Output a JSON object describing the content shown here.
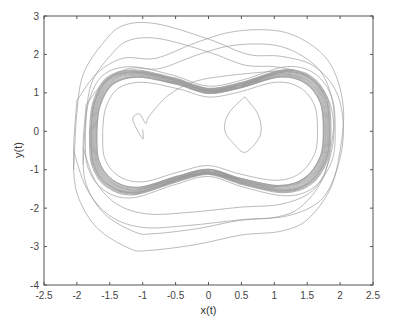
{
  "chart_data": {
    "type": "line",
    "title": "",
    "xlabel": "x(t)",
    "ylabel": "y(t)",
    "xlim": [
      -2.5,
      2.5
    ],
    "ylim": [
      -4,
      3
    ],
    "xticks": [
      -2.5,
      -2,
      -1.5,
      -1,
      -0.5,
      0,
      0.5,
      1,
      1.5,
      2,
      2.5
    ],
    "xtick_labels": [
      "-2.5",
      "-2",
      "-1.5",
      "-1",
      "-0.5",
      "0",
      "0.5",
      "1",
      "1.5",
      "2",
      "2.5"
    ],
    "yticks": [
      -4,
      -3,
      -2,
      -1,
      0,
      1,
      2,
      3
    ],
    "ytick_labels": [
      "-4",
      "-3",
      "-2",
      "-1",
      "0",
      "1",
      "2",
      "3"
    ],
    "grid": false,
    "legend": null,
    "line_color": "#999999",
    "series": [
      {
        "name": "attractor core",
        "points": [
          [
            -1.75,
            0
          ],
          [
            -1.7,
            0.7
          ],
          [
            -1.5,
            1.3
          ],
          [
            -1.1,
            1.5
          ],
          [
            -0.5,
            1.3
          ],
          [
            0,
            1.05
          ],
          [
            0.5,
            1.2
          ],
          [
            1.1,
            1.5
          ],
          [
            1.5,
            1.35
          ],
          [
            1.75,
            0.8
          ],
          [
            1.8,
            0
          ],
          [
            1.75,
            -0.7
          ],
          [
            1.5,
            -1.3
          ],
          [
            1.1,
            -1.5
          ],
          [
            0.5,
            -1.3
          ],
          [
            0,
            -1.05
          ],
          [
            -0.5,
            -1.25
          ],
          [
            -1.1,
            -1.55
          ],
          [
            -1.5,
            -1.35
          ],
          [
            -1.72,
            -0.8
          ],
          [
            -1.75,
            0
          ]
        ]
      },
      {
        "name": "outer transient upper",
        "points": [
          [
            -2.05,
            -1.0
          ],
          [
            -2.0,
            0.5
          ],
          [
            -1.9,
            1.5
          ],
          [
            -1.6,
            2.3
          ],
          [
            -1.3,
            2.75
          ],
          [
            -0.8,
            2.8
          ],
          [
            0,
            2.4
          ],
          [
            0.6,
            2.0
          ],
          [
            1.1,
            1.95
          ],
          [
            1.6,
            1.7
          ],
          [
            1.95,
            1.0
          ],
          [
            2.05,
            0
          ],
          [
            1.95,
            -1.0
          ],
          [
            1.7,
            -1.8
          ],
          [
            1.2,
            -2.2
          ],
          [
            0.5,
            -2.3
          ],
          [
            -0.3,
            -2.45
          ],
          [
            -1.0,
            -2.5
          ],
          [
            -1.5,
            -2.2
          ],
          [
            -1.85,
            -1.5
          ],
          [
            -2.05,
            -0.5
          ]
        ]
      },
      {
        "name": "outer transient lower",
        "points": [
          [
            -2.0,
            0.8
          ],
          [
            -2.05,
            -0.5
          ],
          [
            -2.0,
            -1.6
          ],
          [
            -1.7,
            -2.5
          ],
          [
            -1.2,
            -3.05
          ],
          [
            -0.9,
            -3.1
          ],
          [
            -0.2,
            -2.95
          ],
          [
            0.5,
            -2.7
          ],
          [
            1.1,
            -2.6
          ],
          [
            1.5,
            -2.3
          ],
          [
            1.85,
            -1.5
          ],
          [
            2.0,
            -0.5
          ],
          [
            2.05,
            0.6
          ],
          [
            1.9,
            1.6
          ],
          [
            1.6,
            2.2
          ],
          [
            1.1,
            2.6
          ],
          [
            0.4,
            2.6
          ],
          [
            -0.2,
            2.3
          ],
          [
            -0.8,
            1.9
          ],
          [
            -1.3,
            1.9
          ],
          [
            -1.7,
            1.5
          ],
          [
            -2.0,
            0.8
          ]
        ]
      },
      {
        "name": "initial spiral",
        "points": [
          [
            -1.0,
            0.05
          ],
          [
            -1.0,
            -0.2
          ],
          [
            -1.15,
            0.3
          ],
          [
            -1.05,
            0.45
          ],
          [
            -0.95,
            0.2
          ],
          [
            -0.9,
            0.4
          ],
          [
            -0.6,
            0.95
          ],
          [
            -0.2,
            1.3
          ],
          [
            0.3,
            1.45
          ],
          [
            0.9,
            1.55
          ],
          [
            1.3,
            1.6
          ]
        ]
      },
      {
        "name": "right inner loop",
        "points": [
          [
            0.55,
            0.9
          ],
          [
            0.3,
            0.45
          ],
          [
            0.25,
            0
          ],
          [
            0.4,
            -0.35
          ],
          [
            0.55,
            -0.55
          ],
          [
            0.72,
            -0.3
          ],
          [
            0.8,
            0
          ],
          [
            0.75,
            0.45
          ],
          [
            0.55,
            0.9
          ]
        ]
      }
    ]
  }
}
